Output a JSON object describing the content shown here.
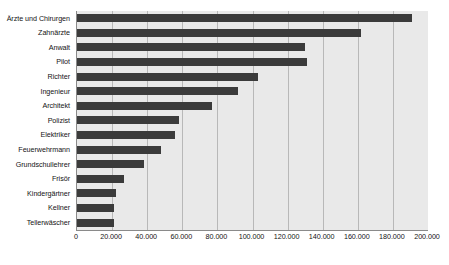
{
  "chart_data": {
    "type": "bar",
    "orientation": "horizontal",
    "title": "",
    "subtitle": "",
    "xlabel": "",
    "ylabel": "",
    "xlim": [
      0,
      200000
    ],
    "xticks": [
      0,
      20000,
      40000,
      60000,
      80000,
      100000,
      120000,
      140000,
      160000,
      180000,
      200000
    ],
    "xtick_labels": [
      "0",
      "20.000",
      "40.000",
      "60.000",
      "80.000",
      "100.000",
      "120.000",
      "140.000",
      "160.000",
      "180.000",
      "200.000"
    ],
    "grid": true,
    "legend": false,
    "categories": [
      "Ärzte und Chirurgen",
      "Zahnärzte",
      "Anwalt",
      "Pilot",
      "Richter",
      "Ingenieur",
      "Architekt",
      "Polizist",
      "Elektriker",
      "Feuerwehrmann",
      "Grundschullehrer",
      "Frisör",
      "Kindergärtner",
      "Kellner",
      "Tellerwäscher"
    ],
    "values": [
      191000,
      162000,
      130000,
      131000,
      103000,
      92000,
      77000,
      58000,
      56000,
      48000,
      38000,
      27000,
      22000,
      21000,
      21000
    ],
    "series": [
      {
        "name": "Einkommen",
        "values": [
          191000,
          162000,
          130000,
          131000,
          103000,
          92000,
          77000,
          58000,
          56000,
          48000,
          38000,
          27000,
          22000,
          21000,
          21000
        ]
      }
    ],
    "colors": {
      "bar": "#3b3b3b",
      "plot_background": "#e9e9e9",
      "gridline": "#b8b8b8",
      "axis_line": "#8a8a8a",
      "text": "#141414",
      "page_background": "#ffffff"
    }
  }
}
